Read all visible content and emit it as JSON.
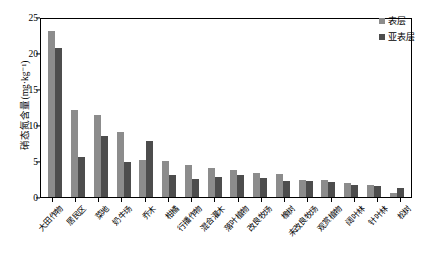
{
  "chart_data": {
    "type": "bar",
    "title": "",
    "xlabel": "",
    "ylabel": "硝态氮含量(mg·kg⁻¹)",
    "ylim": [
      0,
      25
    ],
    "yticks": [
      0,
      5,
      10,
      15,
      20,
      25
    ],
    "grid": false,
    "legend_position": "top-right",
    "categories": [
      "大田作物",
      "居民区",
      "菜地",
      "奶牛场",
      "乔木",
      "柑橘",
      "行播作物",
      "混合灌木",
      "落叶植物",
      "改良牧场",
      "橡树",
      "未改良牧场",
      "观赏植物",
      "阔叶林",
      "针叶林",
      "松树"
    ],
    "series": [
      {
        "name": "表层",
        "color": "#8c8c8c",
        "values": [
          23.0,
          12.1,
          11.4,
          9.0,
          5.2,
          5.0,
          4.4,
          4.0,
          3.8,
          3.4,
          3.2,
          2.3,
          2.3,
          1.9,
          1.7,
          0.6
        ]
      },
      {
        "name": "亚表层",
        "color": "#4d4d4d",
        "values": [
          20.7,
          5.6,
          8.5,
          4.9,
          7.8,
          3.1,
          2.5,
          2.8,
          3.0,
          2.6,
          2.2,
          2.2,
          2.1,
          1.6,
          1.5,
          1.2
        ]
      }
    ]
  },
  "legend": {
    "items": [
      {
        "label": "表层"
      },
      {
        "label": "亚表层"
      }
    ]
  },
  "colors": {
    "series_surface": "#8c8c8c",
    "series_subsurface": "#4d4d4d",
    "axis": "#000000",
    "background": "#ffffff"
  }
}
